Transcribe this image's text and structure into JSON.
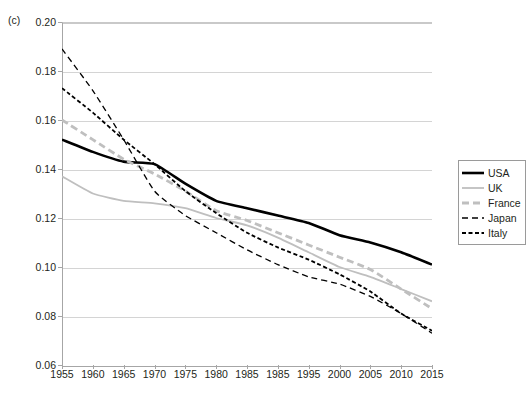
{
  "panel": {
    "label": "(c)"
  },
  "legend": {
    "position": "right",
    "entries": [
      {
        "label": "USA",
        "color": "#000000",
        "width": 2.6,
        "dash": "none",
        "style": "solid"
      },
      {
        "label": "UK",
        "color": "#bfbfbf",
        "width": 1.8,
        "dash": "none",
        "style": "solid"
      },
      {
        "label": "France",
        "color": "#bfbfbf",
        "width": 2.8,
        "dash": "7,4",
        "style": "dashed"
      },
      {
        "label": "Japan",
        "color": "#000000",
        "width": 1.3,
        "dash": "6,4",
        "style": "dashed"
      },
      {
        "label": "Italy",
        "color": "#000000",
        "width": 1.8,
        "dash": "4,2.5",
        "style": "dashed"
      }
    ]
  },
  "axes": {
    "y": {
      "min": 0.06,
      "max": 0.2,
      "step": 0.02,
      "ticks": [
        0.2,
        0.18,
        0.16,
        0.14,
        0.12,
        0.1,
        0.08,
        0.06
      ],
      "tick_labels": [
        "0.20",
        "0.18",
        "0.16",
        "0.14",
        "0.12",
        "0.10",
        "0.08",
        "0.06"
      ],
      "grid": true,
      "label": ""
    },
    "x": {
      "tick_labels": [
        "1955",
        "1960",
        "1965",
        "1970",
        "1975",
        "1980",
        "1985",
        "1985",
        "1995",
        "2000",
        "2005",
        "2010",
        "2015"
      ],
      "grid": false,
      "label": ""
    }
  },
  "chart_data": {
    "type": "line",
    "title": "",
    "subtitle": "",
    "xlabel": "",
    "ylabel": "",
    "xlim": [
      1955,
      2015
    ],
    "ylim": [
      0.06,
      0.2
    ],
    "grid": true,
    "legend_position": "right",
    "annotations": [
      "(c)"
    ],
    "categories": [
      "1955",
      "1960",
      "1965",
      "1970",
      "1975",
      "1980",
      "1985",
      "1985",
      "1995",
      "2000",
      "2005",
      "2010",
      "2015"
    ],
    "x": [
      1955,
      1960,
      1965,
      1970,
      1975,
      1980,
      1985,
      1990,
      1995,
      2000,
      2005,
      2010,
      2015
    ],
    "series": [
      {
        "name": "USA",
        "color": "#000000",
        "style": "solid",
        "values": [
          0.152,
          0.147,
          0.143,
          0.142,
          0.134,
          0.127,
          0.124,
          0.121,
          0.118,
          0.113,
          0.11,
          0.106,
          0.101
        ]
      },
      {
        "name": "UK",
        "color": "#bfbfbf",
        "style": "solid",
        "values": [
          0.137,
          0.13,
          0.127,
          0.126,
          0.124,
          0.12,
          0.117,
          0.112,
          0.106,
          0.1,
          0.096,
          0.091,
          0.086
        ]
      },
      {
        "name": "France",
        "color": "#bfbfbf",
        "style": "dashed",
        "values": [
          0.16,
          0.152,
          0.144,
          0.138,
          0.131,
          0.123,
          0.119,
          0.114,
          0.109,
          0.104,
          0.099,
          0.091,
          0.083
        ]
      },
      {
        "name": "Japan",
        "color": "#000000",
        "style": "dashed",
        "values": [
          0.189,
          0.172,
          0.152,
          0.131,
          0.121,
          0.114,
          0.107,
          0.101,
          0.096,
          0.093,
          0.088,
          0.081,
          0.073
        ]
      },
      {
        "name": "Italy",
        "color": "#000000",
        "style": "dashed",
        "values": [
          0.173,
          0.163,
          0.152,
          0.142,
          0.131,
          0.122,
          0.114,
          0.108,
          0.103,
          0.097,
          0.09,
          0.081,
          0.074
        ]
      }
    ]
  }
}
